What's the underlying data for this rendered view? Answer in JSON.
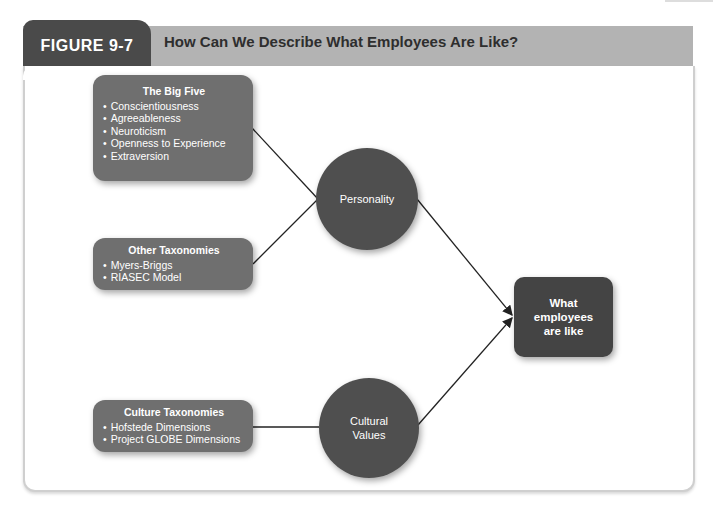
{
  "figure": {
    "label": "FIGURE 9-7",
    "title": "How Can We Describe What Employees Are Like?"
  },
  "boxes": {
    "big_five": {
      "title": "The Big Five",
      "items": [
        "Conscientiousness",
        "Agreeableness",
        "Neuroticism",
        "Openness to Experience",
        "Extraversion"
      ]
    },
    "other_taxonomies": {
      "title": "Other Taxonomies",
      "items": [
        "Myers-Briggs",
        "RIASEC Model"
      ]
    },
    "culture_taxonomies": {
      "title": "Culture Taxonomies",
      "items": [
        "Hofstede Dimensions",
        "Project GLOBE Dimensions"
      ]
    }
  },
  "nodes": {
    "personality": "Personality",
    "cultural_values_line1": "Cultural",
    "cultural_values_line2": "Values",
    "outcome_line1": "What",
    "outcome_line2": "employees",
    "outcome_line3": "are like"
  },
  "colors": {
    "header_bar": "#b3b3b3",
    "figure_tab": "#4a4a4a",
    "taxonomy_box": "#6f6f6f",
    "circle": "#4f4f4f",
    "outcome_box": "#444444"
  }
}
